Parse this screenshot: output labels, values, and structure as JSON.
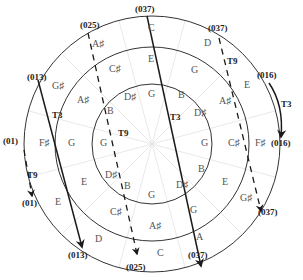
{
  "diagram": {
    "type": "concentric circle pitch-class transformation diagram",
    "center": {
      "x": 152,
      "y": 144
    },
    "circles": [
      {
        "name": "outer",
        "r": 128
      },
      {
        "name": "middle",
        "r": 97
      },
      {
        "name": "inner",
        "r": 60
      }
    ],
    "set_classes": [
      {
        "id": "sc-037-top",
        "label": "(037)",
        "x": 135,
        "y": 12
      },
      {
        "id": "sc-025-top",
        "label": "(025)",
        "x": 80,
        "y": 28
      },
      {
        "id": "sc-037-topright",
        "label": "(037)",
        "x": 208,
        "y": 31
      },
      {
        "id": "sc-013-top",
        "label": "(013)",
        "x": 27,
        "y": 80
      },
      {
        "id": "sc-016-top",
        "label": "(016)",
        "x": 257,
        "y": 78
      },
      {
        "id": "sc-01-top",
        "label": "(01)",
        "x": 3,
        "y": 144
      },
      {
        "id": "sc-016-bottom",
        "label": "(016)",
        "x": 271,
        "y": 146
      },
      {
        "id": "sc-01-bottom",
        "label": "(01)",
        "x": 22,
        "y": 206
      },
      {
        "id": "sc-037-right",
        "label": "(037)",
        "x": 258,
        "y": 215
      },
      {
        "id": "sc-013-bottom",
        "label": "(013)",
        "x": 68,
        "y": 258
      },
      {
        "id": "sc-037-bottom",
        "label": "(037)",
        "x": 188,
        "y": 258
      },
      {
        "id": "sc-025-bottom",
        "label": "(025)",
        "x": 126,
        "y": 270
      }
    ],
    "outer_notes": [
      {
        "label": "C",
        "x": 148,
        "y": 31
      },
      {
        "label": "A♯",
        "x": 92,
        "y": 47
      },
      {
        "label": "D",
        "x": 204,
        "y": 46
      },
      {
        "label": "G♯",
        "x": 52,
        "y": 89
      },
      {
        "label": "E",
        "x": 244,
        "y": 88
      },
      {
        "label": "F♯",
        "x": 39,
        "y": 146
      },
      {
        "label": "F♯",
        "x": 255,
        "y": 146
      },
      {
        "label": "E",
        "x": 55,
        "y": 205
      },
      {
        "label": "G♯",
        "x": 240,
        "y": 201
      },
      {
        "label": "D",
        "x": 95,
        "y": 242
      },
      {
        "label": "A",
        "x": 196,
        "y": 240
      },
      {
        "label": "C",
        "x": 157,
        "y": 256
      }
    ],
    "middle_notes": [
      {
        "label": "E",
        "x": 148,
        "y": 62
      },
      {
        "label": "C♯",
        "x": 109,
        "y": 72
      },
      {
        "label": "G",
        "x": 191,
        "y": 73
      },
      {
        "label": "A♯",
        "x": 77,
        "y": 103
      },
      {
        "label": "A♯",
        "x": 219,
        "y": 104
      },
      {
        "label": "G",
        "x": 68,
        "y": 146
      },
      {
        "label": "C♯",
        "x": 228,
        "y": 146
      },
      {
        "label": "E",
        "x": 81,
        "y": 185
      },
      {
        "label": "E",
        "x": 222,
        "y": 185
      },
      {
        "label": "C♯",
        "x": 110,
        "y": 215
      },
      {
        "label": "G",
        "x": 190,
        "y": 213
      },
      {
        "label": "A♯",
        "x": 149,
        "y": 229
      }
    ],
    "inner_notes": [
      {
        "label": "G",
        "x": 148,
        "y": 97
      },
      {
        "label": "D♯",
        "x": 124,
        "y": 100
      },
      {
        "label": "B",
        "x": 178,
        "y": 98
      },
      {
        "label": "B",
        "x": 107,
        "y": 114
      },
      {
        "label": "D♯",
        "x": 194,
        "y": 116
      },
      {
        "label": "G",
        "x": 100,
        "y": 146
      },
      {
        "label": "G",
        "x": 201,
        "y": 146
      },
      {
        "label": "D♯",
        "x": 105,
        "y": 178
      },
      {
        "label": "B",
        "x": 198,
        "y": 172
      },
      {
        "label": "B",
        "x": 124,
        "y": 189
      },
      {
        "label": "D♯",
        "x": 176,
        "y": 188
      },
      {
        "label": "G",
        "x": 148,
        "y": 198
      }
    ],
    "transformations": [
      {
        "id": "t3-013",
        "label": "T3",
        "style": "solid",
        "from": "(013)",
        "to": "(013)",
        "label_x": 52,
        "label_y": 118
      },
      {
        "id": "t9-025",
        "label": "T9",
        "style": "dashed",
        "from": "(025)",
        "to": "(025)",
        "label_x": 118,
        "label_y": 136
      },
      {
        "id": "t3-037",
        "label": "T3",
        "style": "solid",
        "from": "(037)",
        "to": "(037)",
        "label_x": 170,
        "label_y": 120
      },
      {
        "id": "t9-037",
        "label": "T9",
        "style": "dashed",
        "from": "(037)",
        "to": "(037)",
        "label_x": 227,
        "label_y": 64
      },
      {
        "id": "t3-016",
        "label": "T3",
        "style": "solid-curved",
        "from": "(016)",
        "to": "(016)",
        "label_x": 281,
        "label_y": 107
      },
      {
        "id": "t9-01",
        "label": "T9",
        "style": "dashed",
        "from": "(01)",
        "to": "(01)",
        "label_x": 27,
        "label_y": 178
      }
    ],
    "colors": {
      "line": "#1a1a1a",
      "note_text": "#555555",
      "radial_lines": "#e0e0e0",
      "background": "#ffffff"
    }
  }
}
